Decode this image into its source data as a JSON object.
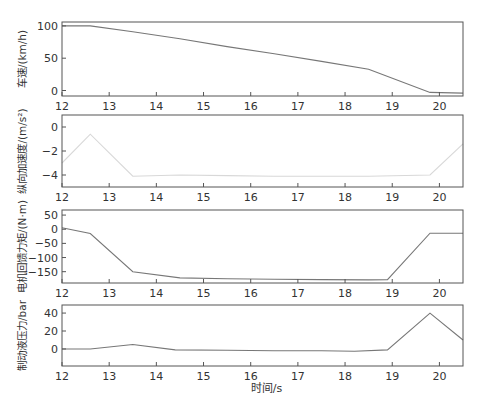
{
  "figure": {
    "xlabel": "时间/s",
    "colors": {
      "frame": "#555555",
      "text": "#333333"
    }
  },
  "chart_data": [
    {
      "type": "line",
      "id": "speed",
      "ylabel": "车速/(km/h)",
      "xlim": [
        12,
        20.5
      ],
      "ylim": [
        -8.5,
        106
      ],
      "xticks": [
        12,
        13,
        14,
        15,
        16,
        17,
        18,
        19,
        20
      ],
      "yticks": [
        0,
        50,
        100
      ],
      "ytick_labels": [
        "0",
        "50",
        "100"
      ],
      "line_color": "#777777",
      "frame": {
        "top": 22,
        "bottom": 96
      },
      "x": [
        12,
        12.6,
        13.5,
        14.5,
        15.5,
        16.5,
        17.5,
        18.5,
        19.8,
        20.5
      ],
      "y": [
        100,
        100,
        91,
        80,
        68,
        57,
        45,
        33,
        -3,
        -4
      ]
    },
    {
      "type": "line",
      "id": "acceleration",
      "ylabel": "纵向加速度/(m/s²)",
      "xlim": [
        12,
        20.5
      ],
      "ylim": [
        -5,
        1
      ],
      "xticks": [
        12,
        13,
        14,
        15,
        16,
        17,
        18,
        19,
        20
      ],
      "yticks": [
        -4,
        -2,
        0
      ],
      "ytick_labels": [
        "−4",
        "−2",
        "0"
      ],
      "line_color": "#d8d8d8",
      "frame": {
        "top": 115,
        "bottom": 187
      },
      "x": [
        12,
        12.6,
        13.5,
        14.5,
        15.5,
        16.5,
        17.5,
        18.5,
        19.8,
        20.5
      ],
      "y": [
        -3.0,
        -0.6,
        -4.1,
        -4.0,
        -4.05,
        -4.1,
        -4.1,
        -4.1,
        -4.0,
        -1.4
      ]
    },
    {
      "type": "line",
      "id": "regen_torque",
      "ylabel": "电机回馈力矩/(N·m)",
      "xlim": [
        12,
        20.5
      ],
      "ylim": [
        -190,
        68
      ],
      "xticks": [
        12,
        13,
        14,
        15,
        16,
        17,
        18,
        19,
        20
      ],
      "yticks": [
        -150,
        -100,
        -50,
        0,
        50
      ],
      "ytick_labels": [
        "−150",
        "−100",
        "−50",
        "0",
        "50"
      ],
      "line_color": "#777777",
      "frame": {
        "top": 210,
        "bottom": 283
      },
      "x": [
        12,
        12.6,
        13.5,
        14.5,
        15.5,
        16.5,
        17.5,
        18.5,
        18.9,
        19.8,
        20.5
      ],
      "y": [
        5,
        -15,
        -150,
        -172,
        -175,
        -177,
        -178,
        -179,
        -178,
        -14,
        -14
      ]
    },
    {
      "type": "line",
      "id": "brake_pressure",
      "ylabel": "制动液压力/bar",
      "xlim": [
        12,
        20.5
      ],
      "ylim": [
        -19,
        49
      ],
      "xticks": [
        12,
        13,
        14,
        15,
        16,
        17,
        18,
        19,
        20
      ],
      "yticks": [
        0,
        20,
        40
      ],
      "ytick_labels": [
        "0",
        "20",
        "40"
      ],
      "line_color": "#777777",
      "frame": {
        "top": 305,
        "bottom": 366
      },
      "x": [
        12,
        12.6,
        13.5,
        14.4,
        15.5,
        16.5,
        17.5,
        18.2,
        18.9,
        19.8,
        20.5
      ],
      "y": [
        0,
        0,
        5,
        -1,
        -1.5,
        -2,
        -2,
        -2.5,
        -1,
        40,
        10
      ]
    }
  ]
}
